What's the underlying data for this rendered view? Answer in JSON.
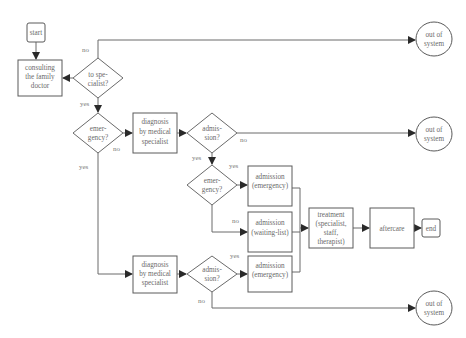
{
  "diagram": {
    "type": "flowchart",
    "nodes": {
      "start": {
        "lines": [
          "start"
        ]
      },
      "consulting": {
        "lines": [
          "consulting",
          "the family",
          "doctor"
        ]
      },
      "to_specialist": {
        "lines": [
          "to spe-",
          "cialist?"
        ]
      },
      "emergency1": {
        "lines": [
          "emer-",
          "gency?"
        ]
      },
      "diagnosis1": {
        "lines": [
          "diagnosis",
          "by medical",
          "specialist"
        ]
      },
      "admission1": {
        "lines": [
          "admis-",
          "sion?"
        ]
      },
      "out1": {
        "lines": [
          "out of",
          "system"
        ]
      },
      "out2": {
        "lines": [
          "out of",
          "system"
        ]
      },
      "emergency2": {
        "lines": [
          "emer-",
          "gency?"
        ]
      },
      "adm_emergency1": {
        "lines": [
          "admission",
          "(emergency)"
        ]
      },
      "adm_waiting": {
        "lines": [
          "admission",
          "(waiting-list)"
        ]
      },
      "treatment": {
        "lines": [
          "treatment",
          "(specialist,",
          "staff,",
          "therapist)"
        ]
      },
      "aftercare": {
        "lines": [
          "aftercare"
        ]
      },
      "end": {
        "lines": [
          "end"
        ]
      },
      "diagnosis2": {
        "lines": [
          "diagnosis",
          "by medical",
          "specialist"
        ]
      },
      "admission2": {
        "lines": [
          "admis-",
          "sion?"
        ]
      },
      "adm_emergency2": {
        "lines": [
          "admission",
          "(emergency)"
        ]
      },
      "out3": {
        "lines": [
          "out of",
          "system"
        ]
      }
    },
    "edge_labels": {
      "spec_no": "no",
      "spec_yes": "yes",
      "emerg1_no": "no",
      "emerg1_yes": "yes",
      "adm1_no": "no",
      "adm1_yes": "yes",
      "emerg2_yes": "yes",
      "emerg2_no": "no",
      "adm2_yes": "yes",
      "adm2_no": "no"
    },
    "colors": {
      "stroke": "#5a5a5a",
      "text": "#6a6a6a",
      "background": "#ffffff"
    }
  }
}
